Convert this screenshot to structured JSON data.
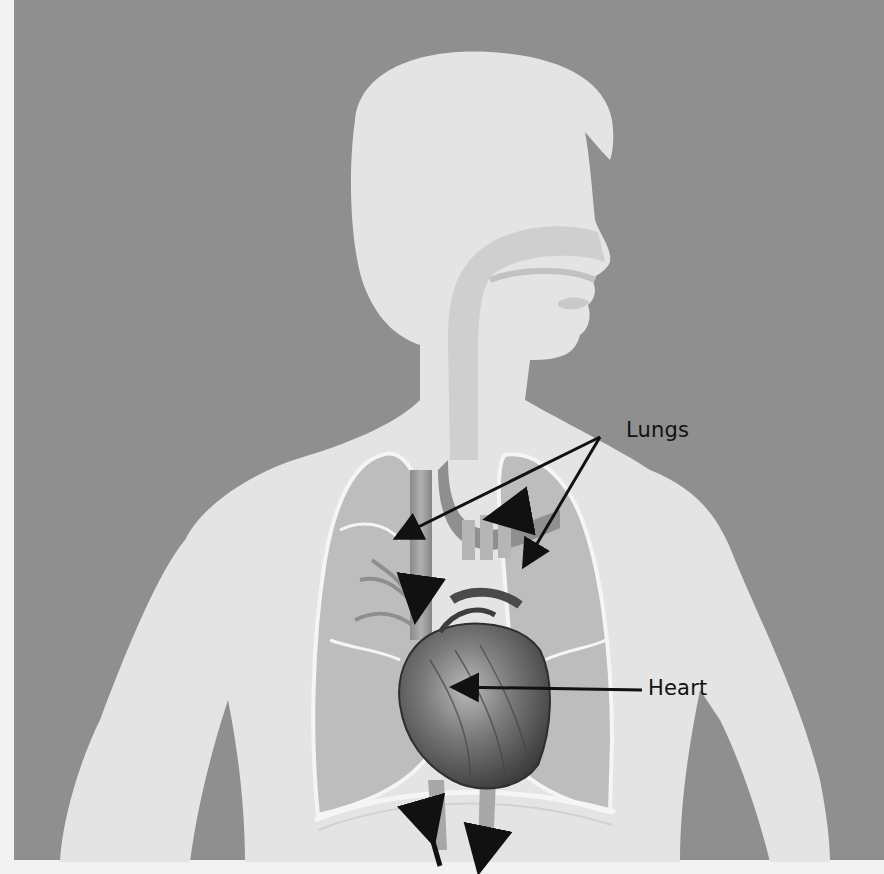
{
  "figure": {
    "colors": {
      "background": "#8f8f8f",
      "paper_margin": "#f2f2f2",
      "silhouette": "#e4e4e4",
      "lung_fill": "#b7b7b7",
      "lung_outline": "#f4f4f4",
      "heart": "#6a6a6a",
      "label_text": "#111111",
      "arrow": "#111111"
    },
    "labels": [
      {
        "id": "lungs",
        "text": "Lungs",
        "x": 626,
        "y": 418
      },
      {
        "id": "heart",
        "text": "Heart",
        "x": 648,
        "y": 650
      }
    ],
    "leader_lines": [
      {
        "label": "lungs",
        "from": [
          600,
          437
        ],
        "to": [
          396,
          538
        ]
      },
      {
        "label": "lungs",
        "from": [
          600,
          437
        ],
        "to": [
          524,
          566
        ]
      },
      {
        "label": "heart",
        "from": [
          642,
          690
        ],
        "to": [
          452,
          687
        ]
      }
    ]
  }
}
